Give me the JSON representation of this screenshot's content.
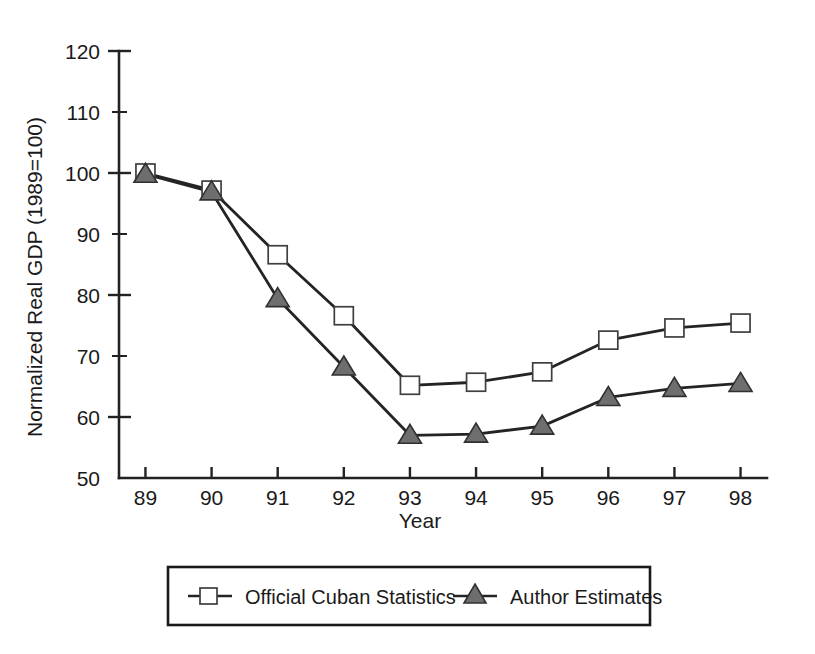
{
  "chart_data": {
    "type": "line",
    "title": "",
    "xlabel": "Year",
    "ylabel": "Normalized Real GDP (1989=100)",
    "categories": [
      "89",
      "90",
      "91",
      "92",
      "93",
      "94",
      "95",
      "96",
      "97",
      "98"
    ],
    "x": [
      1989,
      1990,
      1991,
      1992,
      1993,
      1994,
      1995,
      1996,
      1997,
      1998
    ],
    "xlim": [
      1988.6,
      1998.4
    ],
    "ylim": [
      50,
      120
    ],
    "yticks": [
      50,
      60,
      70,
      80,
      90,
      100,
      110,
      120
    ],
    "yticks_minor": [
      55,
      65,
      75,
      85,
      95,
      105,
      115
    ],
    "ytick_labels": [
      "50",
      "60",
      "70",
      "80",
      "90",
      "100",
      "110",
      "120"
    ],
    "grid": false,
    "legend_position": "below-outside",
    "series": [
      {
        "name": "Official Cuban Statistics",
        "marker": "open-square",
        "marker_fill": "#ffffff",
        "marker_stroke": "#3f3f3f",
        "line_color": "#242424",
        "values": [
          100.0,
          97.2,
          86.6,
          76.6,
          65.2,
          65.7,
          67.4,
          72.6,
          74.6,
          75.4
        ]
      },
      {
        "name": "Author Estimates",
        "marker": "filled-triangle",
        "marker_fill": "#6e6e6e",
        "marker_stroke": "#303030",
        "line_color": "#242424",
        "values": [
          99.8,
          96.9,
          79.4,
          68.2,
          57.0,
          57.2,
          58.5,
          63.2,
          64.7,
          65.5
        ]
      }
    ]
  },
  "legend": {
    "entries": [
      {
        "label": "Official Cuban Statistics",
        "marker": "open-square"
      },
      {
        "label": "Author Estimates",
        "marker": "filled-triangle"
      }
    ]
  },
  "colors": {
    "axis": "#222222",
    "line": "#242424",
    "triangle_fill": "#6e6e6e",
    "square_fill": "#ffffff",
    "text": "#1a1a1a",
    "background": "#ffffff"
  }
}
